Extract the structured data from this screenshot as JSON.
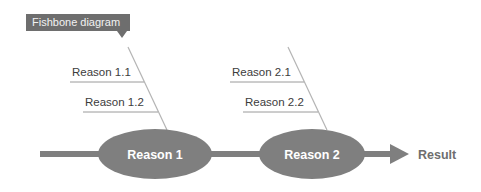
{
  "badge": {
    "text": "Fishbone diagram",
    "background_color": "#6e6e6e",
    "text_color": "#f2f2f2",
    "x": 26,
    "y": 14,
    "width": 104,
    "height": 17,
    "pointer_x": 122,
    "text_x": 32,
    "text_y": 26
  },
  "colors": {
    "spine": "#7f7f7f",
    "node_fill": "#7f7f7f",
    "node_text": "#ffffff",
    "bone_line": "#b4b4b4",
    "underline": "#9a9a9a",
    "label_text": "#3c3c3c",
    "result_text": "#6e6e6e",
    "background": "#ffffff"
  },
  "spine": {
    "y": 154,
    "x_start": 40,
    "x_end": 392,
    "thickness": 6,
    "arrow_tip_x": 409,
    "arrow_back_x": 390,
    "arrow_half_height": 10
  },
  "nodes": [
    {
      "id": "reason-1",
      "label": "Reason 1",
      "cx": 155,
      "cy": 154,
      "rx": 57,
      "ry": 25
    },
    {
      "id": "reason-2",
      "label": "Reason 2",
      "cx": 312,
      "cy": 154,
      "rx": 53,
      "ry": 25
    }
  ],
  "result": {
    "label": "Result",
    "x": 418,
    "y": 159
  },
  "bone_groups": [
    {
      "id": "group-1",
      "node": "reason-1",
      "diagonal": {
        "x1": 128,
        "y1": 47,
        "x2": 167,
        "y2": 130
      },
      "branches": [
        {
          "id": "reason-1-1",
          "label": "Reason 1.1",
          "text_x": 72,
          "text_y": 76,
          "underline_y": 82,
          "underline_x1": 70,
          "underline_x2": 144
        },
        {
          "id": "reason-1-2",
          "label": "Reason 1.2",
          "text_x": 85,
          "text_y": 106,
          "underline_y": 112,
          "underline_x1": 83,
          "underline_x2": 158
        }
      ]
    },
    {
      "id": "group-2",
      "node": "reason-2",
      "diagonal": {
        "x1": 288,
        "y1": 47,
        "x2": 327,
        "y2": 130
      },
      "branches": [
        {
          "id": "reason-2-1",
          "label": "Reason 2.1",
          "text_x": 232,
          "text_y": 76,
          "underline_y": 82,
          "underline_x1": 230,
          "underline_x2": 304
        },
        {
          "id": "reason-2-2",
          "label": "Reason 2.2",
          "text_x": 245,
          "text_y": 106,
          "underline_y": 112,
          "underline_x1": 243,
          "underline_x2": 318
        }
      ]
    }
  ]
}
